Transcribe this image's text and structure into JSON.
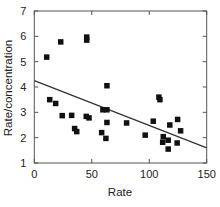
{
  "chart_data": {
    "type": "scatter",
    "title": "",
    "xlabel": "Rate",
    "ylabel": "Rate/concentration",
    "xlim": [
      0,
      150
    ],
    "ylim": [
      1,
      7
    ],
    "xticks": [
      0,
      50,
      100,
      150
    ],
    "yticks": [
      1,
      2,
      3,
      4,
      5,
      6,
      7
    ],
    "grid": false,
    "legend": null,
    "marker": "filled-square",
    "colors": {
      "marker": "#111111",
      "line": "#333333",
      "axis": "#555555",
      "text": "#222222"
    },
    "series": [
      {
        "name": "observations",
        "points": [
          [
            10.8,
            5.18
          ],
          [
            23.0,
            5.78
          ],
          [
            45.6,
            5.85
          ],
          [
            45.6,
            5.97
          ],
          [
            13.4,
            3.5
          ],
          [
            18.6,
            3.35
          ],
          [
            24.3,
            2.87
          ],
          [
            32.5,
            2.88
          ],
          [
            35.1,
            2.36
          ],
          [
            36.9,
            2.24
          ],
          [
            45.2,
            2.84
          ],
          [
            47.6,
            2.78
          ],
          [
            63.2,
            4.05
          ],
          [
            59.7,
            3.1
          ],
          [
            63.2,
            3.1
          ],
          [
            63.2,
            2.6
          ],
          [
            58.6,
            2.2
          ],
          [
            62.3,
            1.97
          ],
          [
            80.3,
            2.58
          ],
          [
            96.5,
            2.1
          ],
          [
            108.4,
            3.6
          ],
          [
            109.3,
            3.5
          ],
          [
            103.5,
            2.65
          ],
          [
            117.9,
            2.5
          ],
          [
            124.7,
            2.72
          ],
          [
            127.3,
            2.27
          ],
          [
            112.2,
            2.04
          ],
          [
            116.5,
            1.9
          ],
          [
            111.7,
            1.82
          ],
          [
            124.3,
            1.79
          ],
          [
            116.5,
            1.55
          ]
        ]
      }
    ],
    "regression_line": {
      "x": [
        0,
        150
      ],
      "y": [
        4.25,
        1.6
      ]
    }
  }
}
